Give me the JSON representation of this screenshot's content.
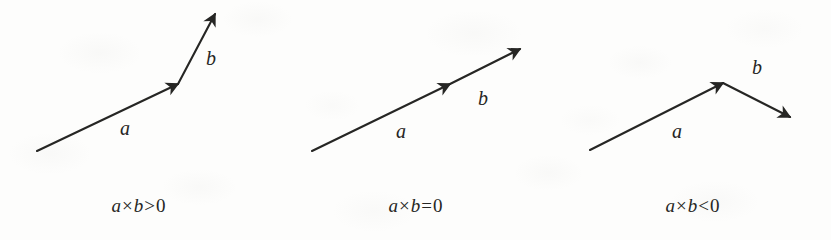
{
  "figure": {
    "type": "vector-cross-product-sign-diagram",
    "background_color": "#fdfdfc",
    "ink_color": "#262624",
    "panels": [
      {
        "id": "positive",
        "caption": {
          "left_symbol": "a",
          "operator": "×",
          "right_symbol": "b",
          "relation": ">",
          "value": "0",
          "full": "a × b > 0"
        },
        "vectors": [
          {
            "name": "a",
            "label": "a",
            "label_x": 125,
            "label_y": 128,
            "x1": 37,
            "y1": 151,
            "x2": 178,
            "y2": 84
          },
          {
            "name": "b",
            "label": "b",
            "label_x": 211,
            "label_y": 58,
            "x1": 178,
            "y1": 84,
            "x2": 215,
            "y2": 14
          }
        ]
      },
      {
        "id": "zero",
        "caption": {
          "left_symbol": "a",
          "operator": "×",
          "right_symbol": "b",
          "relation": "=",
          "value": "0",
          "full": "a × b = 0"
        },
        "vectors": [
          {
            "name": "a",
            "label": "a",
            "label_x": 124,
            "label_y": 131,
            "x1": 35,
            "y1": 151,
            "x2": 173,
            "y2": 84
          },
          {
            "name": "b",
            "label": "b",
            "label_x": 206,
            "label_y": 98,
            "x1": 173,
            "y1": 84,
            "x2": 243,
            "y2": 49
          }
        ]
      },
      {
        "id": "negative",
        "caption": {
          "left_symbol": "a",
          "operator": "×",
          "right_symbol": "b",
          "relation": "<",
          "value": "0",
          "full": "a × b < 0"
        },
        "vectors": [
          {
            "name": "a",
            "label": "a",
            "label_x": 123,
            "label_y": 131,
            "x1": 36,
            "y1": 150,
            "x2": 169,
            "y2": 83
          },
          {
            "name": "b",
            "label": "b",
            "label_x": 203,
            "label_y": 67,
            "x1": 169,
            "y1": 83,
            "x2": 236,
            "y2": 117
          }
        ]
      }
    ]
  }
}
